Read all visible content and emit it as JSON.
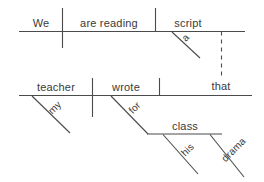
{
  "diagram": {
    "type": "reed-kellogg-sentence-diagram",
    "sentence": "We are reading a script that my teacher wrote for his drama class",
    "ink_color": "#4b4b4b",
    "text_color": "#3a3a3a",
    "background_color": "#ffffff",
    "main_clause": {
      "subject": "We",
      "verb": "are reading",
      "direct_object": "script",
      "article_modifier": "a"
    },
    "relative_clause": {
      "relative_pronoun": "that",
      "subject": "teacher",
      "verb": "wrote",
      "subject_modifier": "my",
      "preposition": "for",
      "prep_object": "class",
      "prep_object_modifiers": [
        "his",
        "drama"
      ]
    },
    "labels": {
      "we": "We",
      "are_reading": "are reading",
      "script": "script",
      "a": "a",
      "that": "that",
      "teacher": "teacher",
      "wrote": "wrote",
      "my": "my",
      "for": "for",
      "class": "class",
      "his": "his",
      "drama": "drama"
    }
  }
}
